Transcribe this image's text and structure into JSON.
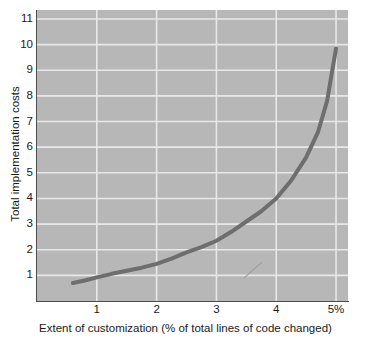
{
  "chart_data": {
    "type": "line",
    "title": "",
    "subtitle": "",
    "xlabel": "Extent of customization (% of total lines of code changed)",
    "ylabel": "Total implementation costs",
    "xlim": [
      0.0,
      5.2
    ],
    "ylim": [
      0,
      11.35
    ],
    "grid": true,
    "legend_position": "none",
    "x_ticks": [
      1,
      2,
      3,
      4,
      5
    ],
    "x_tick_labels": [
      "1",
      "2",
      "3",
      "4",
      "5%"
    ],
    "y_ticks": [
      1,
      2,
      3,
      4,
      5,
      6,
      7,
      8,
      9,
      10,
      11
    ],
    "y_tick_labels": [
      "1",
      "2",
      "3",
      "4",
      "5",
      "6",
      "7",
      "8",
      "9",
      "10",
      "11"
    ],
    "series": [
      {
        "name": "Total implementation costs",
        "color": "#6e6e6e",
        "line_width": 4,
        "x": [
          0.6,
          0.8,
          1.0,
          1.25,
          1.5,
          1.75,
          2.0,
          2.25,
          2.5,
          2.75,
          3.0,
          3.25,
          3.5,
          3.75,
          4.0,
          4.25,
          4.5,
          4.7,
          4.85,
          5.0
        ],
        "values": [
          0.7,
          0.8,
          0.92,
          1.06,
          1.18,
          1.3,
          1.45,
          1.65,
          1.9,
          2.1,
          2.35,
          2.7,
          3.1,
          3.5,
          4.0,
          4.7,
          5.6,
          6.6,
          7.8,
          9.85
        ]
      }
    ],
    "annotations": [
      {
        "name": "scan-artifact-mark",
        "type": "stray-mark",
        "x1": 244,
        "y1": 278,
        "x2": 262,
        "y2": 262,
        "color": "#9a9a9a"
      }
    ],
    "style": {
      "plot_background": "#b7b7b7",
      "figure_background": "#ffffff",
      "gridline_color": "#e8e8e8",
      "axis_color": "#4d4d4d",
      "text_color": "#1a1a1a"
    }
  }
}
